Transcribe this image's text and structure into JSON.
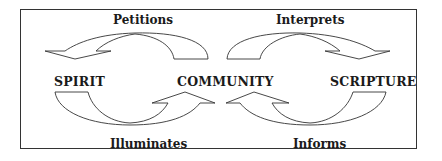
{
  "diagram": {
    "nodes": [
      {
        "id": "spirit",
        "label": "SPIRIT"
      },
      {
        "id": "community",
        "label": "COMMUNITY"
      },
      {
        "id": "scripture",
        "label": "SCRIPTURE"
      }
    ],
    "edges": [
      {
        "id": "petitions",
        "label": "Petitions",
        "from": "community",
        "to": "spirit",
        "position": "top-left"
      },
      {
        "id": "interprets",
        "label": "Interprets",
        "from": "community",
        "to": "scripture",
        "position": "top-right"
      },
      {
        "id": "illuminates",
        "label": "Illuminates",
        "from": "spirit",
        "to": "community",
        "position": "bottom-left"
      },
      {
        "id": "informs",
        "label": "Informs",
        "from": "scripture",
        "to": "community",
        "position": "bottom-right"
      }
    ],
    "colors": {
      "stroke": "#333333",
      "text": "#1a1a1a",
      "background": "#ffffff"
    }
  }
}
